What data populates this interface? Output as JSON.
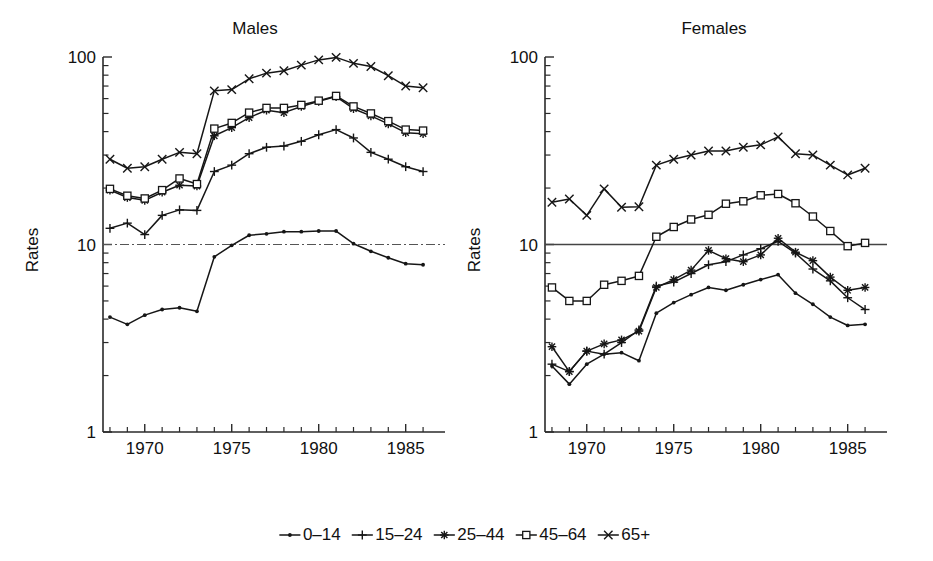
{
  "figure": {
    "ylabel": "Rates",
    "y_ticks": [
      "1",
      "10",
      "100"
    ],
    "x_ticks": [
      "1970",
      "1975",
      "1980",
      "1985"
    ],
    "reference_line_value": 10
  },
  "legend": {
    "items": [
      {
        "label": "0–14",
        "marker": "dot"
      },
      {
        "label": "15–24",
        "marker": "plus"
      },
      {
        "label": "25–44",
        "marker": "asterisk"
      },
      {
        "label": "45–64",
        "marker": "square"
      },
      {
        "label": "65+",
        "marker": "cross"
      }
    ]
  },
  "chart_data": [
    {
      "type": "line",
      "title": "Males",
      "xlabel": "",
      "ylabel": "Rates",
      "yscale": "log",
      "ylim": [
        1,
        100
      ],
      "xlim": [
        1967.6,
        1986.8
      ],
      "grid": false,
      "yticks": [
        1,
        10,
        100
      ],
      "xticks": [
        1970,
        1975,
        1980,
        1985
      ],
      "legend_position": "below-figure",
      "annotations": [
        "horizontal reference line at rate = 10"
      ],
      "x": [
        1968,
        1969,
        1970,
        1971,
        1972,
        1973,
        1974,
        1975,
        1976,
        1977,
        1978,
        1979,
        1980,
        1981,
        1982,
        1983,
        1984,
        1985,
        1986
      ],
      "series": [
        {
          "name": "0–14",
          "marker": "dot",
          "values": [
            4.1,
            3.75,
            4.2,
            4.5,
            4.6,
            4.4,
            8.6,
            9.9,
            11.2,
            11.4,
            11.7,
            11.7,
            11.8,
            11.8,
            10.1,
            9.2,
            8.5,
            7.9,
            7.8
          ]
        },
        {
          "name": "15–24",
          "marker": "plus",
          "values": [
            12.2,
            13.0,
            11.3,
            14.3,
            15.3,
            15.2,
            24.5,
            26.5,
            30.5,
            33.0,
            33.5,
            35.5,
            38.5,
            41.0,
            37.0,
            31.0,
            28.5,
            26.0,
            24.5
          ]
        },
        {
          "name": "25–44",
          "marker": "asterisk",
          "values": [
            19.5,
            17.8,
            17.2,
            19.0,
            20.7,
            20.5,
            38.0,
            42.0,
            47.5,
            52.0,
            50.5,
            54.5,
            58.0,
            61.5,
            53.0,
            48.5,
            44.0,
            39.5,
            39.0
          ]
        },
        {
          "name": "45–64",
          "marker": "square",
          "values": [
            19.8,
            18.2,
            17.6,
            19.5,
            22.5,
            21.0,
            41.5,
            44.5,
            50.5,
            53.5,
            53.5,
            55.5,
            58.5,
            62.0,
            54.5,
            50.0,
            45.5,
            41.0,
            40.5
          ]
        },
        {
          "name": "65+",
          "marker": "cross",
          "values": [
            28.5,
            25.5,
            26.0,
            28.5,
            31.0,
            30.5,
            66.0,
            67.0,
            76.5,
            82.0,
            84.5,
            90.5,
            96.5,
            99.5,
            92.5,
            89.0,
            79.5,
            70.0,
            68.5
          ]
        }
      ]
    },
    {
      "type": "line",
      "title": "Females",
      "xlabel": "",
      "ylabel": "Rates",
      "yscale": "log",
      "ylim": [
        1,
        100
      ],
      "xlim": [
        1967.6,
        1986.8
      ],
      "grid": false,
      "yticks": [
        1,
        10,
        100
      ],
      "xticks": [
        1970,
        1975,
        1980,
        1985
      ],
      "legend_position": "below-figure",
      "annotations": [
        "horizontal reference line at rate = 10"
      ],
      "x": [
        1968,
        1969,
        1970,
        1971,
        1972,
        1973,
        1974,
        1975,
        1976,
        1977,
        1978,
        1979,
        1980,
        1981,
        1982,
        1983,
        1984,
        1985,
        1986
      ],
      "series": [
        {
          "name": "0–14",
          "marker": "dot",
          "values": [
            2.25,
            1.8,
            2.3,
            2.6,
            2.65,
            2.4,
            4.3,
            4.9,
            5.4,
            5.9,
            5.7,
            6.1,
            6.5,
            6.9,
            5.5,
            4.8,
            4.1,
            3.7,
            3.75
          ]
        },
        {
          "name": "15–24",
          "marker": "plus",
          "values": [
            2.3,
            2.1,
            2.7,
            2.6,
            3.0,
            3.5,
            6.0,
            6.3,
            7.0,
            7.8,
            8.1,
            8.8,
            9.5,
            10.4,
            9.0,
            7.4,
            6.4,
            5.2,
            4.5
          ]
        },
        {
          "name": "25–44",
          "marker": "asterisk",
          "values": [
            2.85,
            2.1,
            2.7,
            2.95,
            3.1,
            3.45,
            5.9,
            6.5,
            7.3,
            9.3,
            8.4,
            8.1,
            8.8,
            10.8,
            9.1,
            8.2,
            6.7,
            5.7,
            5.9
          ]
        },
        {
          "name": "45–64",
          "marker": "square",
          "values": [
            5.9,
            5.0,
            5.0,
            6.1,
            6.4,
            6.8,
            11.0,
            12.4,
            13.6,
            14.4,
            16.5,
            17.0,
            18.3,
            18.6,
            16.6,
            14.1,
            11.8,
            9.8,
            10.2
          ]
        },
        {
          "name": "65+",
          "marker": "cross",
          "values": [
            16.8,
            17.5,
            14.3,
            19.8,
            15.8,
            15.9,
            26.5,
            28.5,
            30.0,
            31.5,
            31.5,
            33.0,
            34.0,
            37.5,
            30.5,
            30.0,
            26.5,
            23.5,
            25.5
          ]
        }
      ]
    }
  ]
}
